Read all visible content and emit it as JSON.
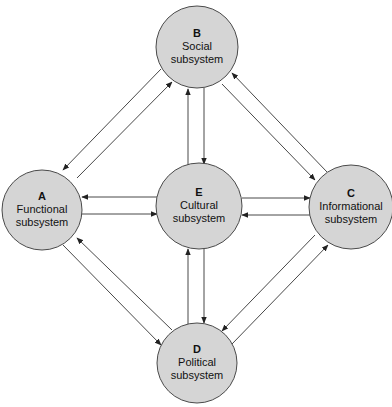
{
  "diagram": {
    "colors": {
      "node_fill": "#d5d5d5",
      "node_stroke": "#4a4a4a",
      "edge": "#333333",
      "background": "#ffffff"
    },
    "nodes": [
      {
        "id": "A",
        "letter": "A",
        "line1": "Functional",
        "line2": "subsystem",
        "cx": 42,
        "cy": 210,
        "r": 40
      },
      {
        "id": "B",
        "letter": "B",
        "line1": "Social",
        "line2": "subsystem",
        "cx": 197,
        "cy": 47,
        "r": 41
      },
      {
        "id": "C",
        "letter": "C",
        "line1": "Informational",
        "line2": "subsystem",
        "cx": 351,
        "cy": 207,
        "r": 42
      },
      {
        "id": "D",
        "letter": "D",
        "line1": "Political",
        "line2": "subsystem",
        "cx": 197,
        "cy": 363,
        "r": 40
      },
      {
        "id": "E",
        "letter": "E",
        "line1": "Cultural",
        "line2": "subsystem",
        "cx": 199,
        "cy": 206,
        "r": 43
      }
    ],
    "edges": [
      {
        "from": "B",
        "to": "A",
        "x1": 161,
        "y1": 69,
        "x2": 63,
        "y2": 170
      },
      {
        "from": "A",
        "to": "B",
        "x1": 77,
        "y1": 178,
        "x2": 172,
        "y2": 82
      },
      {
        "from": "C",
        "to": "B",
        "x1": 327,
        "y1": 172,
        "x2": 232,
        "y2": 73
      },
      {
        "from": "B",
        "to": "C",
        "x1": 222,
        "y1": 84,
        "x2": 315,
        "y2": 180
      },
      {
        "from": "E",
        "to": "B",
        "x1": 188,
        "y1": 165,
        "x2": 188,
        "y2": 89
      },
      {
        "from": "B",
        "to": "E",
        "x1": 204,
        "y1": 88,
        "x2": 204,
        "y2": 164
      },
      {
        "from": "E",
        "to": "A",
        "x1": 157,
        "y1": 197,
        "x2": 82,
        "y2": 197
      },
      {
        "from": "A",
        "to": "E",
        "x1": 82,
        "y1": 214,
        "x2": 157,
        "y2": 214
      },
      {
        "from": "E",
        "to": "C",
        "x1": 242,
        "y1": 198,
        "x2": 310,
        "y2": 198
      },
      {
        "from": "C",
        "to": "E",
        "x1": 310,
        "y1": 215,
        "x2": 242,
        "y2": 215
      },
      {
        "from": "D",
        "to": "E",
        "x1": 188,
        "y1": 324,
        "x2": 188,
        "y2": 249
      },
      {
        "from": "E",
        "to": "D",
        "x1": 204,
        "y1": 249,
        "x2": 204,
        "y2": 323
      },
      {
        "from": "D",
        "to": "A",
        "x1": 172,
        "y1": 330,
        "x2": 77,
        "y2": 238
      },
      {
        "from": "A",
        "to": "D",
        "x1": 63,
        "y1": 245,
        "x2": 161,
        "y2": 345
      },
      {
        "from": "C",
        "to": "D",
        "x1": 315,
        "y1": 235,
        "x2": 222,
        "y2": 331
      },
      {
        "from": "D",
        "to": "C",
        "x1": 232,
        "y1": 344,
        "x2": 328,
        "y2": 245
      }
    ]
  }
}
